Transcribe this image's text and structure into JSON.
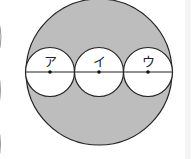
{
  "diagram": {
    "labels": {
      "a": "ア",
      "b": "イ",
      "c": "ウ"
    },
    "colors": {
      "shaded": "#bdbdbd",
      "stroke": "#222222",
      "background": "#ffffff"
    },
    "large_circle": {
      "cx": 99,
      "cy": 72,
      "r": 73
    },
    "small_circles": [
      {
        "label": "ア",
        "cx": 50,
        "cy": 72,
        "r": 24
      },
      {
        "label": "イ",
        "cx": 99,
        "cy": 72,
        "r": 24
      },
      {
        "label": "ウ",
        "cx": 148,
        "cy": 72,
        "r": 24
      }
    ]
  }
}
